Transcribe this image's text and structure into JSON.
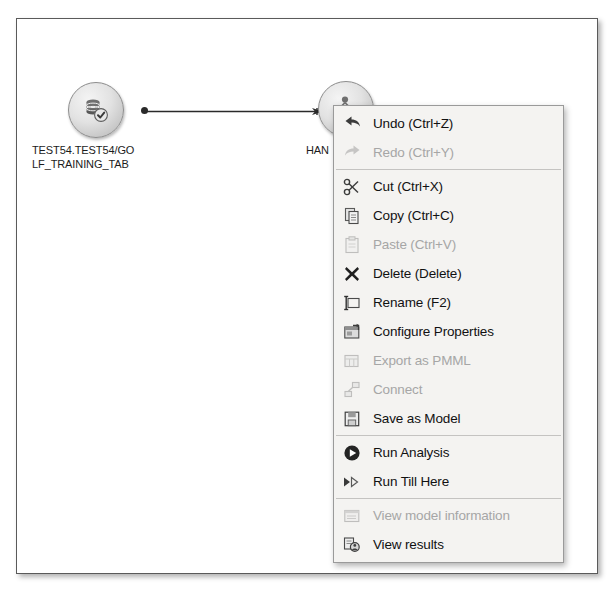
{
  "canvas": {
    "nodes": [
      {
        "id": "source",
        "label": "TEST54.TEST54/GO\nLF_TRAINING_TAB",
        "icon": "database-node-icon"
      },
      {
        "id": "model",
        "label": "HAN",
        "icon": "decision-tree-node-icon"
      }
    ],
    "connector": {
      "from": "source",
      "to": "model",
      "style": "arrow"
    }
  },
  "context_menu": {
    "groups": [
      {
        "items": [
          {
            "label": "Undo (Ctrl+Z)",
            "icon": "undo-icon",
            "enabled": true
          },
          {
            "label": "Redo (Ctrl+Y)",
            "icon": "redo-icon",
            "enabled": false
          }
        ]
      },
      {
        "items": [
          {
            "label": "Cut (Ctrl+X)",
            "icon": "scissors-icon",
            "enabled": true
          },
          {
            "label": "Copy (Ctrl+C)",
            "icon": "copy-icon",
            "enabled": true
          },
          {
            "label": "Paste (Ctrl+V)",
            "icon": "clipboard-icon",
            "enabled": false
          },
          {
            "label": "Delete (Delete)",
            "icon": "delete-x-icon",
            "enabled": true
          },
          {
            "label": "Rename (F2)",
            "icon": "rename-icon",
            "enabled": true
          },
          {
            "label": "Configure Properties",
            "icon": "configure-properties-icon",
            "enabled": true
          },
          {
            "label": "Export as PMML",
            "icon": "export-pmml-icon",
            "enabled": false
          },
          {
            "label": "Connect",
            "icon": "connect-icon",
            "enabled": false
          },
          {
            "label": "Save as Model",
            "icon": "save-model-icon",
            "enabled": true
          }
        ]
      },
      {
        "items": [
          {
            "label": "Run Analysis",
            "icon": "play-circle-icon",
            "enabled": true
          },
          {
            "label": "Run Till Here",
            "icon": "fast-forward-icon",
            "enabled": true
          }
        ]
      },
      {
        "items": [
          {
            "label": "View model information",
            "icon": "model-information-icon",
            "enabled": false
          },
          {
            "label": "View results",
            "icon": "view-results-icon",
            "enabled": true
          }
        ]
      }
    ]
  },
  "caption": {
    "text": ""
  },
  "colors": {
    "menu_background": "#f4f3f1",
    "menu_border": "#9a9a9a",
    "text": "#111111",
    "text_disabled": "#a6a6a6",
    "separator": "#c4c3c1",
    "frame_border": "#5a5a5a",
    "connector": "#2a2a2a"
  }
}
